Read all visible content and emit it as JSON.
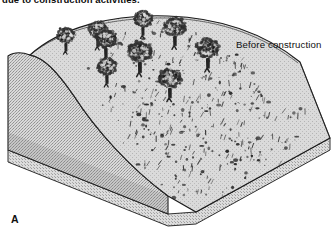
{
  "figure": {
    "panel_letter": "A",
    "cropped_caption": "due to construction activities.",
    "annotation_label": "Before construction",
    "type": "block-diagram",
    "colors": {
      "background": "#ffffff",
      "outline": "#1a1a1a",
      "slope_surface": "#d6d6d6",
      "cut_face_stipple": "#c8c8c8",
      "base_slab": "#cccccc",
      "tree_canopy": "#303030",
      "tree_trunk": "#242424",
      "ground_speckle": "#3a3a3a"
    },
    "block": {
      "left_face_label": "stippled soil cut face",
      "top_face_label": "vegetated hillslope surface",
      "front_slab_label": "base slab edge"
    },
    "trees": [
      {
        "id": "tree-1",
        "x": 66,
        "y": 43,
        "scale": 0.8
      },
      {
        "id": "tree-2",
        "x": 98,
        "y": 38,
        "scale": 0.86
      },
      {
        "id": "tree-3",
        "x": 106,
        "y": 48,
        "scale": 0.92
      },
      {
        "id": "tree-4",
        "x": 143,
        "y": 27,
        "scale": 0.82
      },
      {
        "id": "tree-5",
        "x": 107,
        "y": 75,
        "scale": 0.86
      },
      {
        "id": "tree-6",
        "x": 140,
        "y": 62,
        "scale": 1.04
      },
      {
        "id": "tree-7",
        "x": 175,
        "y": 36,
        "scale": 0.95
      },
      {
        "id": "tree-8",
        "x": 170,
        "y": 88,
        "scale": 0.98
      },
      {
        "id": "tree-9",
        "x": 208,
        "y": 58,
        "scale": 1.0
      }
    ],
    "shrubs": [
      {
        "x": 118,
        "y": 44,
        "r": 16
      },
      {
        "x": 131,
        "y": 52,
        "r": 22
      },
      {
        "x": 100,
        "y": 66,
        "r": 14
      },
      {
        "x": 148,
        "y": 48,
        "r": 18
      },
      {
        "x": 163,
        "y": 31,
        "r": 12
      },
      {
        "x": 190,
        "y": 40,
        "r": 14
      },
      {
        "x": 196,
        "y": 60,
        "r": 26
      },
      {
        "x": 210,
        "y": 78,
        "r": 20
      },
      {
        "x": 178,
        "y": 70,
        "r": 18
      },
      {
        "x": 158,
        "y": 82,
        "r": 22
      },
      {
        "x": 140,
        "y": 92,
        "r": 16
      },
      {
        "x": 124,
        "y": 88,
        "r": 13
      },
      {
        "x": 150,
        "y": 104,
        "r": 20
      },
      {
        "x": 172,
        "y": 110,
        "r": 24
      },
      {
        "x": 192,
        "y": 98,
        "r": 18
      },
      {
        "x": 206,
        "y": 112,
        "r": 22
      },
      {
        "x": 222,
        "y": 92,
        "r": 16
      },
      {
        "x": 236,
        "y": 104,
        "r": 20
      },
      {
        "x": 218,
        "y": 126,
        "r": 24
      },
      {
        "x": 198,
        "y": 134,
        "r": 18
      },
      {
        "x": 180,
        "y": 128,
        "r": 20
      },
      {
        "x": 162,
        "y": 136,
        "r": 16
      },
      {
        "x": 146,
        "y": 126,
        "r": 14
      },
      {
        "x": 134,
        "y": 114,
        "r": 18
      },
      {
        "x": 164,
        "y": 152,
        "r": 22
      },
      {
        "x": 186,
        "y": 156,
        "r": 18
      },
      {
        "x": 208,
        "y": 148,
        "r": 20
      },
      {
        "x": 230,
        "y": 140,
        "r": 24
      },
      {
        "x": 248,
        "y": 122,
        "r": 18
      },
      {
        "x": 258,
        "y": 138,
        "r": 20
      },
      {
        "x": 240,
        "y": 160,
        "r": 16
      },
      {
        "x": 222,
        "y": 168,
        "r": 22
      },
      {
        "x": 200,
        "y": 172,
        "r": 18
      },
      {
        "x": 182,
        "y": 178,
        "r": 14
      },
      {
        "x": 246,
        "y": 178,
        "r": 20
      },
      {
        "x": 266,
        "y": 160,
        "r": 18
      },
      {
        "x": 276,
        "y": 120,
        "r": 16
      },
      {
        "x": 286,
        "y": 142,
        "r": 20
      },
      {
        "x": 262,
        "y": 102,
        "r": 14
      },
      {
        "x": 176,
        "y": 190,
        "r": 18
      },
      {
        "x": 204,
        "y": 192,
        "r": 16
      },
      {
        "x": 228,
        "y": 196,
        "r": 14
      },
      {
        "x": 296,
        "y": 116,
        "r": 14
      },
      {
        "x": 252,
        "y": 90,
        "r": 12
      },
      {
        "x": 232,
        "y": 74,
        "r": 14
      },
      {
        "x": 214,
        "y": 46,
        "r": 12
      },
      {
        "x": 226,
        "y": 58,
        "r": 16
      },
      {
        "x": 244,
        "y": 68,
        "r": 12
      },
      {
        "x": 112,
        "y": 102,
        "r": 14
      },
      {
        "x": 128,
        "y": 138,
        "r": 16
      },
      {
        "x": 148,
        "y": 166,
        "r": 14
      },
      {
        "x": 160,
        "y": 118,
        "r": 16
      },
      {
        "x": 190,
        "y": 116,
        "r": 14
      },
      {
        "x": 270,
        "y": 178,
        "r": 14
      }
    ]
  }
}
